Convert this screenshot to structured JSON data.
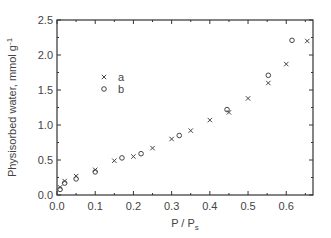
{
  "chart_data": {
    "type": "scatter",
    "title": "",
    "xlabel": "P / P",
    "xlabel_sub": "s",
    "ylabel": "Physisorbed water, mmol g",
    "ylabel_sup": "-1",
    "xlim": [
      0.0,
      0.67
    ],
    "ylim": [
      0.0,
      2.5
    ],
    "x_ticks": [
      "0.0",
      "0.1",
      "0.2",
      "0.3",
      "0.4",
      "0.5",
      "0.6"
    ],
    "y_ticks": [
      "0.0",
      "0.5",
      "1.0",
      "1.5",
      "2.0",
      "2.5"
    ],
    "grid": false,
    "legend_position": "upper-left-inside",
    "series": [
      {
        "name": "a",
        "marker": "x",
        "points": [
          [
            0.008,
            0.11
          ],
          [
            0.02,
            0.2
          ],
          [
            0.05,
            0.27
          ],
          [
            0.1,
            0.36
          ],
          [
            0.15,
            0.49
          ],
          [
            0.2,
            0.55
          ],
          [
            0.25,
            0.67
          ],
          [
            0.3,
            0.8
          ],
          [
            0.35,
            0.92
          ],
          [
            0.4,
            1.07
          ],
          [
            0.45,
            1.18
          ],
          [
            0.5,
            1.38
          ],
          [
            0.553,
            1.6
          ],
          [
            0.6,
            1.87
          ],
          [
            0.655,
            2.2
          ]
        ]
      },
      {
        "name": "b",
        "marker": "o",
        "points": [
          [
            0.008,
            0.08
          ],
          [
            0.02,
            0.17
          ],
          [
            0.05,
            0.23
          ],
          [
            0.1,
            0.33
          ],
          [
            0.17,
            0.53
          ],
          [
            0.22,
            0.59
          ],
          [
            0.32,
            0.85
          ],
          [
            0.445,
            1.22
          ],
          [
            0.553,
            1.71
          ],
          [
            0.615,
            2.21
          ]
        ]
      }
    ]
  },
  "legend": {
    "items": [
      {
        "label": "a",
        "marker": "×"
      },
      {
        "label": "b",
        "marker": "o"
      }
    ]
  },
  "colors": {
    "axis": "#333333",
    "marker": "#444444",
    "background": "#ffffff"
  }
}
